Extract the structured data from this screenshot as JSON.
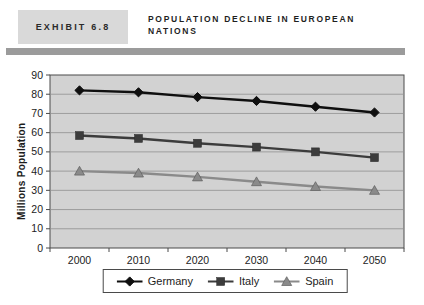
{
  "header": {
    "exhibit_label": "EXHIBIT 6.8",
    "title_line1": "POPULATION DECLINE IN EUROPEAN",
    "title_line2": "NATIONS"
  },
  "colors": {
    "exhibit_box_bg": "#d9d9d9",
    "divider_bar": "#9b9b9b",
    "plot_bg": "#d2d2d2",
    "gridline": "#8f8f8f",
    "axis": "#4a4a4a",
    "tick_text": "#1c1c1c",
    "legend_border": "#4a4a4a"
  },
  "chart_data": {
    "type": "line",
    "x": [
      "2000",
      "2010",
      "2020",
      "2030",
      "2040",
      "2050"
    ],
    "series": [
      {
        "name": "Germany",
        "marker": "diamond",
        "color": "#0f0f0f",
        "values": [
          82,
          81,
          78.5,
          76.5,
          73.5,
          70.5
        ]
      },
      {
        "name": "Italy",
        "marker": "square",
        "color": "#3c3c3c",
        "values": [
          58.5,
          57,
          54.5,
          52.5,
          50,
          47
        ]
      },
      {
        "name": "Spain",
        "marker": "triangle",
        "color": "#8a8a8a",
        "values": [
          40,
          39,
          37,
          34.5,
          32,
          30
        ]
      }
    ],
    "title": "POPULATION DECLINE IN EUROPEAN NATIONS",
    "xlabel": "",
    "ylabel": "Millions Population",
    "ylim": [
      0,
      90
    ],
    "ytick_interval": 10,
    "grid": true,
    "legend_position": "bottom"
  }
}
